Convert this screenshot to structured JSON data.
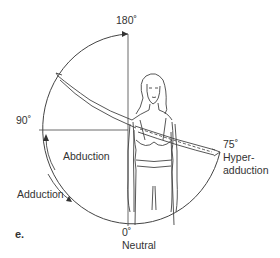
{
  "figure": {
    "panel_label": "e.",
    "angles": {
      "top": "180˚",
      "left": "90˚",
      "right": "75˚",
      "bottom": "0˚"
    },
    "labels": {
      "abduction": "Abduction",
      "adduction": "Adduction",
      "hyper_line1": "Hyper-",
      "hyper_line2": "adduction",
      "neutral": "Neutral"
    },
    "colors": {
      "line": "#444444",
      "text": "#333333",
      "background": "#ffffff"
    }
  }
}
